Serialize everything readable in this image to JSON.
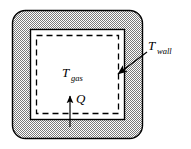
{
  "figure": {
    "labels": {
      "gas_symbol": "T",
      "gas_subscript": "gas",
      "wall_symbol": "T",
      "wall_subscript": "wall",
      "heat_symbol": "Q"
    },
    "colors": {
      "wall_fill": "#b4b4b4",
      "wall_hatch": "#8a8a8a",
      "outline": "#000000",
      "interior_fill": "#ffffff",
      "background": "#ffffff"
    },
    "geometry": {
      "outer_x": 12,
      "outer_y": 10,
      "outer_width": 131,
      "outer_height": 129,
      "outer_corner_radius": 13,
      "solid_inner_x": 30,
      "solid_inner_y": 29,
      "solid_inner_width": 95,
      "solid_inner_height": 91,
      "dashed_x": 36,
      "dashed_y": 35,
      "dashed_width": 83,
      "dashed_height": 79
    },
    "annotations": {
      "wall_leader_from_x": 143,
      "wall_leader_from_y": 50,
      "wall_leader_to_x": 116,
      "wall_leader_to_y": 73,
      "heat_arrow_x": 70,
      "heat_arrow_tail_y": 126,
      "heat_arrow_head_y": 96
    }
  }
}
